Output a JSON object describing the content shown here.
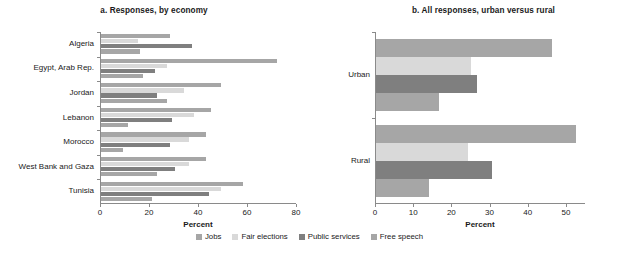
{
  "chart_data": [
    {
      "type": "bar",
      "title": "a. Responses, by economy",
      "orientation": "horizontal",
      "xlabel": "Percent",
      "ylabel": "",
      "xlim": [
        0,
        80
      ],
      "xticks": [
        0,
        20,
        40,
        60,
        80
      ],
      "grid": false,
      "legend_position": "bottom",
      "categories": [
        "Algeria",
        "Egypt, Arab Rep.",
        "Jordan",
        "Lebanon",
        "Morocco",
        "West Bank and Gaza",
        "Tunisia"
      ],
      "series": [
        {
          "name": "Jobs",
          "color": "#a6a6a6",
          "values": [
            28,
            72,
            49,
            45,
            43,
            43,
            58
          ]
        },
        {
          "name": "Fair elections",
          "color": "#d9d9d9",
          "values": [
            15,
            27,
            34,
            38,
            36,
            36,
            49
          ]
        },
        {
          "name": "Public services",
          "color": "#7f7f7f",
          "values": [
            37,
            22,
            23,
            29,
            28,
            30,
            44
          ]
        },
        {
          "name": "Free speech",
          "color": "#a6a6a6",
          "values": [
            16,
            17,
            27,
            11,
            9,
            23,
            21
          ]
        }
      ]
    },
    {
      "type": "bar",
      "title": "b. All responses, urban versus rural",
      "orientation": "horizontal",
      "xlabel": "Percent",
      "ylabel": "",
      "xlim": [
        0,
        55
      ],
      "xticks": [
        0,
        10,
        20,
        30,
        40,
        50
      ],
      "grid": false,
      "legend_position": "bottom",
      "categories": [
        "Urban",
        "Rural"
      ],
      "series": [
        {
          "name": "Jobs",
          "color": "#a6a6a6",
          "values": [
            46.0,
            52.5
          ]
        },
        {
          "name": "Fair elections",
          "color": "#d9d9d9",
          "values": [
            25.0,
            24.0
          ]
        },
        {
          "name": "Public services",
          "color": "#7f7f7f",
          "values": [
            26.5,
            30.5
          ]
        },
        {
          "name": "Free speech",
          "color": "#a6a6a6",
          "values": [
            16.5,
            14.0
          ]
        }
      ]
    }
  ],
  "legend": {
    "items": [
      {
        "label": "Jobs",
        "color": "#a6a6a6"
      },
      {
        "label": "Fair elections",
        "color": "#d9d9d9"
      },
      {
        "label": "Public services",
        "color": "#7f7f7f"
      },
      {
        "label": "Free speech",
        "color": "#a6a6a6"
      }
    ]
  }
}
